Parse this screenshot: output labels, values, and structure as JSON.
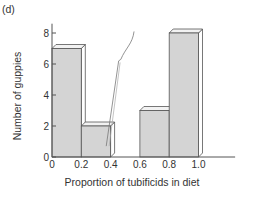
{
  "chart_data": {
    "type": "bar",
    "panel_label": "(d)",
    "title": "",
    "xlabel": "Proportion of tubificids in diet",
    "ylabel": "Number of guppies",
    "bins": [
      {
        "from": 0.0,
        "to": 0.2,
        "value": 7
      },
      {
        "from": 0.2,
        "to": 0.4,
        "value": 2
      },
      {
        "from": 0.4,
        "to": 0.6,
        "value": 0
      },
      {
        "from": 0.6,
        "to": 0.8,
        "value": 3
      },
      {
        "from": 0.8,
        "to": 1.0,
        "value": 8
      }
    ],
    "x_ticks": [
      "0",
      "0.2",
      "0.4",
      "0.6",
      "0.8",
      "1.0"
    ],
    "x_tick_values": [
      0,
      0.2,
      0.4,
      0.6,
      0.8,
      1.0
    ],
    "y_ticks": [
      "0",
      "2",
      "4",
      "6",
      "8"
    ],
    "y_tick_values": [
      0,
      2,
      4,
      6,
      8
    ],
    "xlim": [
      0,
      1.25
    ],
    "ylim": [
      0,
      8.6
    ],
    "grid": false,
    "legend": "none",
    "style": "3d-histogram",
    "colors": {
      "bar_front": "#d4d4d4",
      "bar_top": "#f2f2f2",
      "bar_side": "#ffffff",
      "stroke": "#555555",
      "axis": "#555555"
    }
  }
}
